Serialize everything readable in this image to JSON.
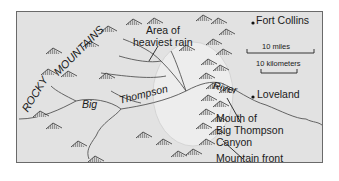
{
  "map": {
    "range_label_1": "ROCKY",
    "range_label_2": "MOUNTAINS",
    "rain_area_label_line1": "Area of",
    "rain_area_label_line2": "heaviest rain",
    "river_label_1": "Big",
    "river_label_2": "Thompson",
    "river_label_3": "River",
    "canyon_label_line1": "Mouth of",
    "canyon_label_line2": "Big Thompson",
    "canyon_label_line3": "Canyon",
    "front_label": "Mountain front",
    "cities": [
      {
        "name": "Fort Collins"
      },
      {
        "name": "Loveland"
      }
    ],
    "scale": {
      "miles": "10 miles",
      "kilometers": "10 kilometers"
    },
    "colors": {
      "land": "#e2e2e2",
      "rain_area": "#ececec",
      "river": "#555555",
      "text": "#1a1a1a"
    }
  }
}
